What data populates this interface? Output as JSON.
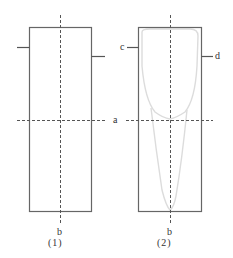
{
  "figure": {
    "panels": [
      {
        "caption": "(1)",
        "axis_label_h": "a",
        "axis_label_v": "b"
      },
      {
        "caption": "(2)",
        "axis_label_v": "b",
        "label_left": "c",
        "label_right": "d"
      }
    ]
  },
  "colors": {
    "frame": "#666666",
    "dashed": "#555555",
    "outline": "#d8d8d8",
    "text": "#333333"
  }
}
